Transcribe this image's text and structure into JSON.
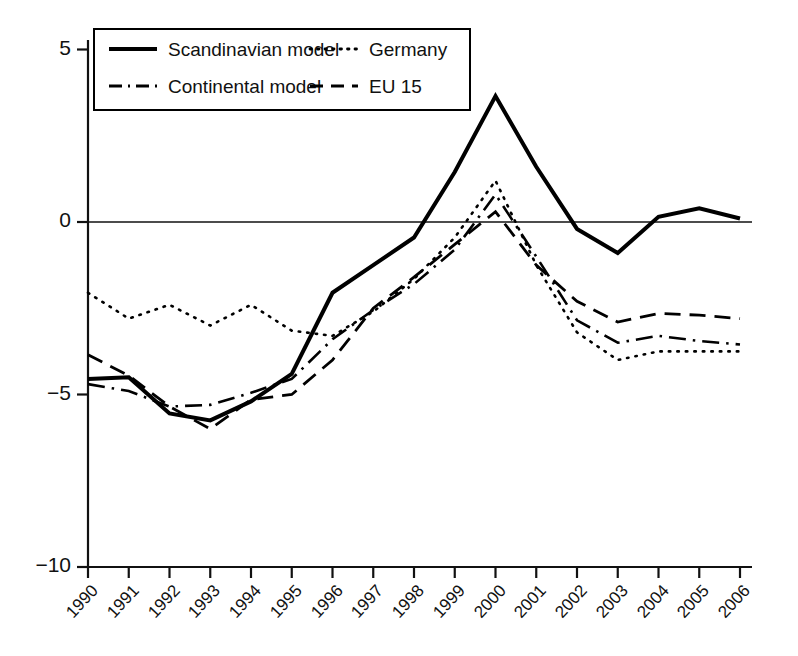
{
  "chart_data": {
    "type": "line",
    "title": "",
    "xlabel": "",
    "ylabel": "",
    "grid": false,
    "legend_position": "top-left-inside",
    "x": [
      1990,
      1991,
      1992,
      1993,
      1994,
      1995,
      1996,
      1997,
      1998,
      1999,
      2000,
      2001,
      2002,
      2003,
      2004,
      2005,
      2006
    ],
    "categories": [
      "1990",
      "1991",
      "1992",
      "1993",
      "1994",
      "1995",
      "1996",
      "1997",
      "1998",
      "1999",
      "2000",
      "2001",
      "2002",
      "2003",
      "2004",
      "2005",
      "2006"
    ],
    "xlim": [
      1990,
      2006
    ],
    "ylim": [
      -10,
      5
    ],
    "yticks": [
      5,
      0,
      -5,
      -10
    ],
    "ytick_labels": [
      "5",
      "0",
      "−5",
      "−10"
    ],
    "zero_line": 0,
    "series": [
      {
        "name": "Scandinavian model",
        "style": "solid",
        "color": "#000000",
        "width": 4.0,
        "values": [
          -4.55,
          -4.5,
          -5.55,
          -5.75,
          -5.2,
          -4.4,
          -2.05,
          -1.25,
          -0.45,
          1.45,
          3.65,
          1.6,
          -0.2,
          -0.9,
          0.15,
          0.4,
          0.1
        ]
      },
      {
        "name": "Germany",
        "style": "dotted",
        "color": "#000000",
        "width": 2.6,
        "values": [
          -2.05,
          -2.8,
          -2.4,
          -3.0,
          -2.4,
          -3.15,
          -3.3,
          -2.6,
          -1.65,
          -0.45,
          1.2,
          -1.25,
          -3.2,
          -4.0,
          -3.75,
          -3.75,
          -3.75
        ]
      },
      {
        "name": "Continental model",
        "style": "dashdot",
        "color": "#000000",
        "width": 2.6,
        "values": [
          -4.7,
          -4.9,
          -5.35,
          -5.3,
          -4.95,
          -4.55,
          -3.4,
          -2.55,
          -1.8,
          -0.8,
          0.8,
          -1.0,
          -2.85,
          -3.5,
          -3.3,
          -3.45,
          -3.55
        ]
      },
      {
        "name": "EU 15",
        "style": "dashed",
        "color": "#000000",
        "width": 2.8,
        "values": [
          -3.85,
          -4.45,
          -5.35,
          -6.0,
          -5.15,
          -5.0,
          -4.0,
          -2.5,
          -1.6,
          -0.65,
          0.3,
          -1.25,
          -2.3,
          -2.9,
          -2.65,
          -2.7,
          -2.8
        ]
      }
    ]
  },
  "axis": {
    "ytick_labels": [
      "5",
      "0",
      "−5",
      "−10"
    ],
    "xtick_labels": [
      "1990",
      "1991",
      "1992",
      "1993",
      "1994",
      "1995",
      "1996",
      "1997",
      "1998",
      "1999",
      "2000",
      "2001",
      "2002",
      "2003",
      "2004",
      "2005",
      "2006"
    ]
  },
  "legend": {
    "entries": [
      {
        "label": "Scandinavian model",
        "style": "solid"
      },
      {
        "label": "Germany",
        "style": "dotted"
      },
      {
        "label": "Continental model",
        "style": "dashdot"
      },
      {
        "label": "EU 15",
        "style": "dashed"
      }
    ]
  }
}
